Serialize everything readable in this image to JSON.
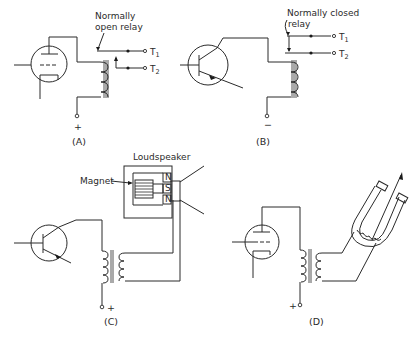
{
  "figure": {
    "panels": [
      {
        "id": "A",
        "caption": "(A)",
        "device": "vacuum triode tube",
        "annotation": [
          "Normally",
          "open relay"
        ],
        "terminals": [
          "T",
          "T"
        ],
        "terminal_subscripts": [
          "1",
          "2"
        ],
        "supply": "+"
      },
      {
        "id": "B",
        "caption": "(B)",
        "device": "transistor",
        "annotation": [
          "Normally closed",
          "relay"
        ],
        "terminals": [
          "T",
          "T"
        ],
        "terminal_subscripts": [
          "1",
          "2"
        ],
        "supply": "−"
      },
      {
        "id": "C",
        "caption": "(C)",
        "device": "transistor",
        "title": "Loudspeaker",
        "magnet_label": "Magnet",
        "poles": [
          "N",
          "S",
          "N"
        ],
        "supply": "+"
      },
      {
        "id": "D",
        "caption": "(D)",
        "device": "vacuum triode tube",
        "supply": "+"
      }
    ]
  }
}
